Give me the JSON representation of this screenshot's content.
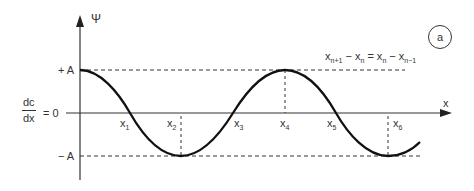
{
  "figure": {
    "panel_label": "a",
    "y_axis_label": "Ψ",
    "x_axis_label": "x",
    "plus_amplitude_label": "+ A",
    "minus_amplitude_label": "− A",
    "derivative": {
      "numerator": "dc",
      "denominator": "dx",
      "equals": "= 0"
    },
    "equation": {
      "parts": [
        "x",
        "n+1",
        " − x",
        "n",
        " = x",
        "n",
        " − x",
        "n−1"
      ]
    },
    "points": [
      {
        "label": "x",
        "sub": "1"
      },
      {
        "label": "x",
        "sub": "2"
      },
      {
        "label": "x",
        "sub": "3"
      },
      {
        "label": "x",
        "sub": "4"
      },
      {
        "label": "x",
        "sub": "5"
      },
      {
        "label": "x",
        "sub": "6"
      }
    ],
    "colors": {
      "curve": "#111111",
      "axis": "#333333",
      "dashed": "#333333"
    }
  }
}
